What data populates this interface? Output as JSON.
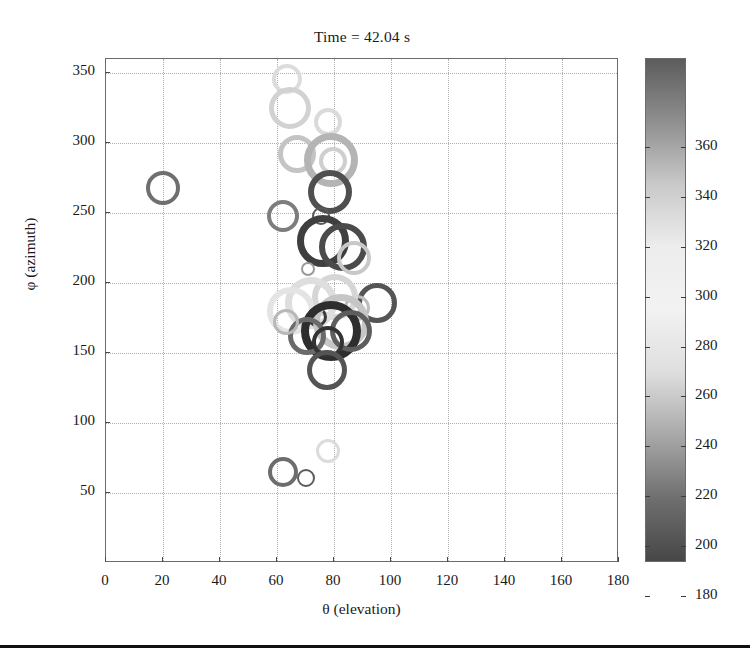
{
  "figure": {
    "title": "Time = 42.04 s",
    "bottom_rule": true
  },
  "axes": {
    "xlabel": "θ (elevation)",
    "ylabel": "φ (azimuth)",
    "xticks": [
      "0",
      "20",
      "40",
      "60",
      "80",
      "100",
      "120",
      "140",
      "160",
      "180"
    ],
    "yticks": [
      "50",
      "100",
      "150",
      "200",
      "250",
      "300",
      "350"
    ],
    "xlim": [
      0,
      180
    ],
    "ylim": [
      0,
      360
    ],
    "grid": "dotted",
    "grid_color": "#b0b0b0",
    "box_color": "#6b6b6b"
  },
  "colorbar": {
    "orientation": "vertical",
    "ticks": [
      "180",
      "200",
      "220",
      "240",
      "260",
      "280",
      "300",
      "320",
      "340",
      "360"
    ],
    "lim": [
      170,
      372
    ],
    "colormap": "grayscale-jet",
    "stops": [
      "#5c5c5c",
      "#8f8f8f",
      "#c9c9c9",
      "#ededed",
      "#f2f2f2",
      "#dedede",
      "#a8a8a8",
      "#6f6f6f",
      "#474747"
    ]
  },
  "chart_data": {
    "type": "scatter",
    "title": "Time = 42.04 s",
    "xlabel": "θ (elevation)",
    "ylabel": "φ (azimuth)",
    "xlim": [
      0,
      180
    ],
    "ylim": [
      0,
      360
    ],
    "xticks": [
      0,
      20,
      40,
      60,
      80,
      100,
      120,
      140,
      160,
      180
    ],
    "yticks": [
      50,
      100,
      150,
      200,
      250,
      300,
      350
    ],
    "grid": true,
    "legend": "none",
    "marker": "open-circle",
    "colorbar_label": "",
    "colorbar_lim": [
      170,
      372
    ],
    "note": "Bubble size encodes magnitude; marker gray level encodes colorbar value",
    "points": [
      {
        "x": 20.0,
        "y": 268,
        "size": 17,
        "color": "#6f6f6f"
      },
      {
        "x": 63.5,
        "y": 346,
        "size": 15,
        "color": "#dcdcdc"
      },
      {
        "x": 64.5,
        "y": 325,
        "size": 21,
        "color": "#d2d2d2"
      },
      {
        "x": 78.0,
        "y": 315,
        "size": 14,
        "color": "#dadada"
      },
      {
        "x": 67.0,
        "y": 292,
        "size": 19,
        "color": "#c4c4c4"
      },
      {
        "x": 79.0,
        "y": 288,
        "size": 27,
        "color": "#b4b4b4"
      },
      {
        "x": 79.5,
        "y": 287,
        "size": 14,
        "color": "#cfcfcf"
      },
      {
        "x": 78.5,
        "y": 265,
        "size": 22,
        "color": "#4f4f4f"
      },
      {
        "x": 62.0,
        "y": 248,
        "size": 16,
        "color": "#7d7d7d"
      },
      {
        "x": 75.5,
        "y": 248,
        "size": 9,
        "color": "#5a5a5a"
      },
      {
        "x": 76.0,
        "y": 230,
        "size": 26,
        "color": "#3f3f3f"
      },
      {
        "x": 83.0,
        "y": 226,
        "size": 24,
        "color": "#4b4b4b"
      },
      {
        "x": 87.0,
        "y": 218,
        "size": 17,
        "color": "#c8c8c8"
      },
      {
        "x": 71.0,
        "y": 210,
        "size": 7,
        "color": "#9a9a9a"
      },
      {
        "x": 95.0,
        "y": 186,
        "size": 20,
        "color": "#555555"
      },
      {
        "x": 88.0,
        "y": 182,
        "size": 13,
        "color": "#bdbdbd"
      },
      {
        "x": 80.5,
        "y": 190,
        "size": 23,
        "color": "#d6d6d6"
      },
      {
        "x": 72.0,
        "y": 186,
        "size": 26,
        "color": "#dedede"
      },
      {
        "x": 65.0,
        "y": 180,
        "size": 24,
        "color": "#e4e4e4"
      },
      {
        "x": 74.0,
        "y": 176,
        "size": 10,
        "color": "#3a3a3a"
      },
      {
        "x": 82.5,
        "y": 172,
        "size": 28,
        "color": "#c6c6c6"
      },
      {
        "x": 79.0,
        "y": 166,
        "size": 30,
        "color": "#2e2e2e"
      },
      {
        "x": 86.0,
        "y": 166,
        "size": 21,
        "color": "#5e5e5e"
      },
      {
        "x": 70.5,
        "y": 162,
        "size": 19,
        "color": "#6a6a6a"
      },
      {
        "x": 78.0,
        "y": 158,
        "size": 16,
        "color": "#333333"
      },
      {
        "x": 63.0,
        "y": 172,
        "size": 13,
        "color": "#b8b8b8"
      },
      {
        "x": 77.5,
        "y": 138,
        "size": 20,
        "color": "#545454"
      },
      {
        "x": 62.0,
        "y": 65,
        "size": 15,
        "color": "#6d6d6d"
      },
      {
        "x": 70.0,
        "y": 61,
        "size": 9,
        "color": "#5c5c5c"
      },
      {
        "x": 78.0,
        "y": 80,
        "size": 12,
        "color": "#dcdcdc"
      }
    ]
  }
}
